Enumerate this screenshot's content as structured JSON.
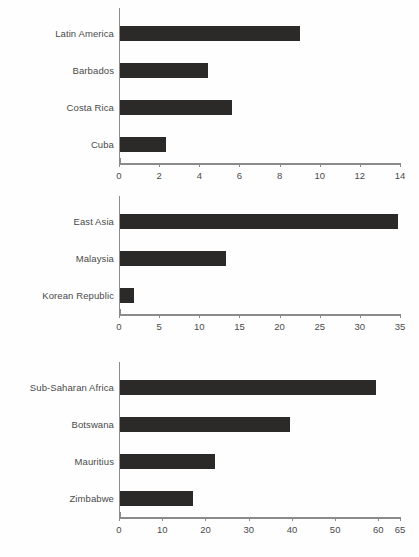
{
  "document": {
    "background_color": "#fefefe",
    "bar_color": "#2b2a28",
    "axis_color": "#8b8b8b",
    "text_color": "#4a4a4a"
  },
  "chart_data": [
    {
      "type": "bar",
      "orientation": "horizontal",
      "title": "",
      "xlabel": "",
      "ylabel": "",
      "categories": [
        "Latin America",
        "Barbados",
        "Costa Rica",
        "Cuba"
      ],
      "values": [
        9.0,
        4.4,
        5.6,
        2.3
      ],
      "xlim": [
        0,
        14
      ],
      "xticks": [
        0,
        2,
        4,
        6,
        8,
        10,
        12,
        14
      ],
      "xticklabels": [
        "0",
        "2",
        "4",
        "6",
        "8",
        "10",
        "12",
        "14"
      ],
      "grid": false,
      "legend": "none"
    },
    {
      "type": "bar",
      "orientation": "horizontal",
      "title": "",
      "xlabel": "",
      "ylabel": "",
      "categories": [
        "East Asia",
        "Malaysia",
        "Korean Republic"
      ],
      "values": [
        34.8,
        13.2,
        1.7
      ],
      "xlim": [
        0,
        35
      ],
      "xticks": [
        0,
        5,
        10,
        15,
        20,
        25,
        30,
        35
      ],
      "xticklabels": [
        "0",
        "5",
        "10",
        "15",
        "20",
        "25",
        "30",
        "35"
      ],
      "grid": false,
      "legend": "none"
    },
    {
      "type": "bar",
      "orientation": "horizontal",
      "title": "",
      "xlabel": "",
      "ylabel": "",
      "categories": [
        "Sub-Saharan Africa",
        "Botswana",
        "Mauritius",
        "Zimbabwe"
      ],
      "values": [
        59.5,
        39.5,
        22.0,
        17.0
      ],
      "xlim": [
        0,
        65
      ],
      "xticks": [
        0,
        10,
        20,
        30,
        40,
        50,
        60,
        65
      ],
      "xticklabels": [
        "0",
        "10",
        "20",
        "30",
        "40",
        "50",
        "60",
        "65"
      ],
      "grid": false,
      "legend": "none"
    }
  ]
}
